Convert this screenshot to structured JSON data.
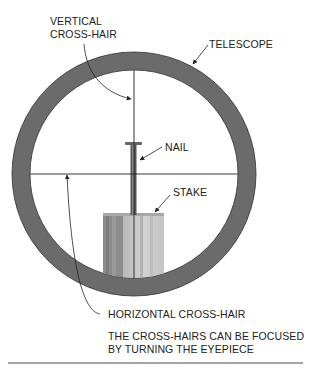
{
  "labels": {
    "vertical_crosshair_line1": "VERTICAL",
    "vertical_crosshair_line2": "CROSS-HAIR",
    "telescope": "TELESCOPE",
    "nail": "NAIL",
    "stake": "STAKE",
    "horizontal_crosshair": "HORIZONTAL CROSS-HAIR"
  },
  "caption": {
    "line1": "THE CROSS-HAIRS CAN BE FOCUSED",
    "line2": "BY TURNING THE EYEPIECE"
  },
  "colors": {
    "ring": "#6b6b6b",
    "ring_edge": "#333333",
    "stake_dark": "#8a8a8a",
    "stake_light": "#c9c9c9",
    "line": "#222222"
  }
}
